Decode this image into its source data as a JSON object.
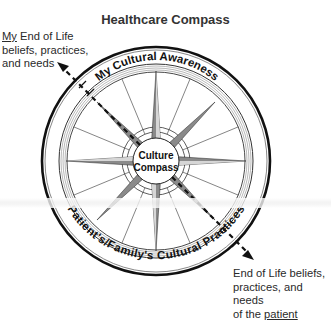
{
  "diagram": {
    "title": "Healthcare Compass",
    "top_left_note": {
      "underlined": "My",
      "rest_line1": " End of Life",
      "line2": "beliefs, practices,",
      "line3": "and needs"
    },
    "bottom_right_note": {
      "line1": "End of Life beliefs,",
      "line2": "practices, and needs",
      "prefix_line3": "of the ",
      "underlined": "patient"
    },
    "outer_ring_top_label": "My Cultural Awareness",
    "outer_ring_bottom_label": "Patient's/Family's Cultural Practices",
    "center_label_line1": "Culture",
    "center_label_line2": "Compass",
    "arrows": [
      {
        "name": "my-beliefs-arrow",
        "direction": "up-left",
        "style": "dashed"
      },
      {
        "name": "patient-beliefs-arrow",
        "direction": "down-right",
        "style": "dashed"
      }
    ],
    "colors": {
      "ink": "#111111",
      "star_fill": "#8a8a8a",
      "ring_gray": "#9a9a9a"
    }
  }
}
